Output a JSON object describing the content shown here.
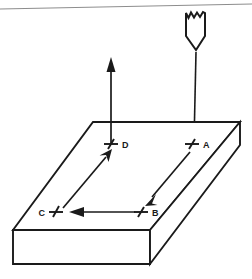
{
  "figure": {
    "type": "technical-line-diagram",
    "background_color": "#ffffff",
    "line_color": "#1a1a1a",
    "artifact_line_color": "#8d8d8d"
  },
  "tool": {
    "name": "cutting-tool",
    "description": "pointed tool / stylus with jagged broken top edge",
    "shaft_label": "",
    "tip_direction": "down",
    "descent_line": "vertical line from tool tip down to point A"
  },
  "workpiece": {
    "name": "rectangular-block",
    "description": "isometric rectangular slab (plate) seen from above-left",
    "top_face": "parallelogram",
    "front_face": "rectangle",
    "right_face": "parallelogram"
  },
  "points": [
    {
      "id": "A",
      "label": "A",
      "label_side": "right",
      "marker": "tick-cross",
      "x": 192,
      "y": 144
    },
    {
      "id": "B",
      "label": "B",
      "label_side": "right",
      "marker": "tick-cross",
      "x": 141,
      "y": 212
    },
    {
      "id": "C",
      "label": "C",
      "label_side": "left",
      "marker": "tick-cross",
      "x": 56,
      "y": 212
    },
    {
      "id": "D",
      "label": "D",
      "label_side": "right",
      "marker": "tick-cross",
      "x": 111,
      "y": 144
    }
  ],
  "path_segments": [
    {
      "from": "A",
      "to": "B",
      "direction": "down-left",
      "arrowhead": "at B"
    },
    {
      "from": "B",
      "to": "C",
      "direction": "left",
      "arrowhead": "at C side"
    },
    {
      "from": "C",
      "to": "D",
      "direction": "up-right",
      "arrowhead": "at D"
    },
    {
      "from": "D",
      "to": "exit",
      "direction": "up",
      "arrowhead": "at top"
    }
  ],
  "annotations": {
    "entry_arrow": "vertical line descending onto point A",
    "exit_arrow": "vertical arrow ascending from point D"
  }
}
